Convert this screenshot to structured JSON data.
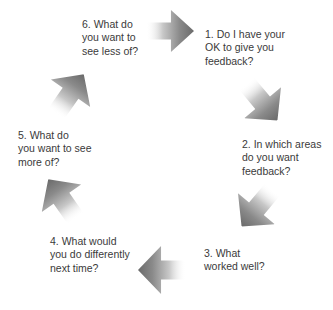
{
  "diagram": {
    "type": "feedback-cycle",
    "steps": [
      {
        "number": 1,
        "text": "1. Do I have your\nOK to give you\nfeedback?"
      },
      {
        "number": 2,
        "text": "2. In which areas\ndo you want\nfeedback?"
      },
      {
        "number": 3,
        "text": "3. What\nworked well?"
      },
      {
        "number": 4,
        "text": "4. What would\nyou do differently\nnext time?"
      },
      {
        "number": 5,
        "text": "5. What do\nyou want to see\nmore of?"
      },
      {
        "number": 6,
        "text": "6. What do\nyou want to\nsee less of?"
      }
    ],
    "arrows": [
      {
        "from": 6,
        "to": 1,
        "direction": "right",
        "icon": "arrow-right-icon"
      },
      {
        "from": 1,
        "to": 2,
        "direction": "down-right",
        "icon": "arrow-down-right-icon"
      },
      {
        "from": 2,
        "to": 3,
        "direction": "down-left",
        "icon": "arrow-down-left-icon"
      },
      {
        "from": 3,
        "to": 4,
        "direction": "left",
        "icon": "arrow-left-icon"
      },
      {
        "from": 4,
        "to": 5,
        "direction": "up-left",
        "icon": "arrow-up-left-icon"
      },
      {
        "from": 5,
        "to": 6,
        "direction": "up-right",
        "icon": "arrow-up-right-icon"
      }
    ],
    "colors": {
      "arrow_tip": "#6e6e6e",
      "arrow_tail": "#ffffff",
      "text": "#3a3a3a",
      "background": "#ffffff"
    }
  }
}
